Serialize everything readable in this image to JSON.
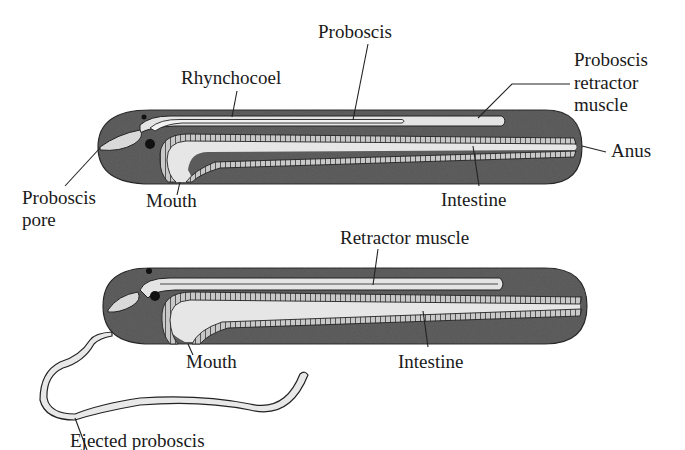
{
  "diagram": {
    "colors": {
      "background": "#ffffff",
      "body_fill": "#5f5f5f",
      "lumen_fill": "#e6e6e6",
      "gut_wall": "#bdbdbd",
      "outline": "#222222",
      "text": "#1a1a1a"
    },
    "panels": [
      {
        "id": "retracted",
        "labels": {
          "proboscis": "Proboscis",
          "rhynchocoel": "Rhynchocoel",
          "retractor_line1": "Proboscis",
          "retractor_line2": "retractor",
          "retractor_line3": "muscle",
          "anus": "Anus",
          "pore_line1": "Proboscis",
          "pore_line2": "pore",
          "mouth": "Mouth",
          "intestine": "Intestine"
        }
      },
      {
        "id": "everted",
        "labels": {
          "retractor": "Retractor muscle",
          "mouth": "Mouth",
          "intestine": "Intestine",
          "ejected": "Ejected proboscis"
        }
      }
    ]
  }
}
